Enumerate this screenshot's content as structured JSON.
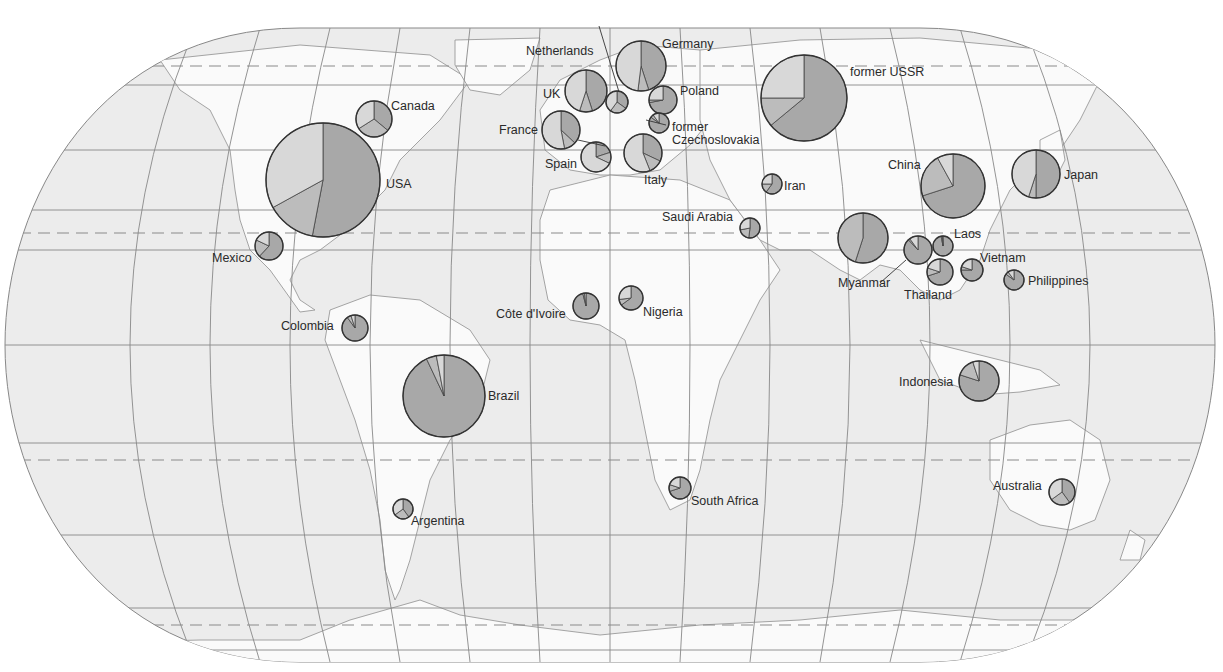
{
  "map": {
    "projection": "Eckert IV (rounded-edge world projection)",
    "colors": {
      "background": "#ffffff",
      "ocean": "#ececec",
      "land": "#fafafa",
      "graticule": "#888888",
      "tropic_dashes": "#8a8a8a",
      "coast": "#9a9a9a",
      "pie_dark": "#a8a8a8",
      "pie_mid": "#bcbcbc",
      "pie_light": "#d8d8d8",
      "pie_outline": "#333333"
    }
  },
  "chart_data": {
    "type": "pie",
    "title": "",
    "series_names": [
      "dark",
      "medium",
      "light"
    ],
    "countries": [
      {
        "name": "USA",
        "cx": 323,
        "cy": 180,
        "r": 57,
        "shares": [
          0.53,
          0.14,
          0.33
        ]
      },
      {
        "name": "Canada",
        "cx": 374,
        "cy": 119,
        "r": 18,
        "shares": [
          0.36,
          0.3,
          0.34
        ]
      },
      {
        "name": "Mexico",
        "cx": 269,
        "cy": 246,
        "r": 14,
        "shares": [
          0.62,
          0.2,
          0.18
        ]
      },
      {
        "name": "Colombia",
        "cx": 355,
        "cy": 328,
        "r": 13,
        "shares": [
          0.9,
          0.05,
          0.05
        ]
      },
      {
        "name": "Brazil",
        "cx": 444,
        "cy": 396,
        "r": 41,
        "shares": [
          0.93,
          0.04,
          0.03
        ]
      },
      {
        "name": "Argentina",
        "cx": 403,
        "cy": 509,
        "r": 10,
        "shares": [
          0.4,
          0.25,
          0.35
        ]
      },
      {
        "name": "UK",
        "cx": 586,
        "cy": 91,
        "r": 21,
        "shares": [
          0.45,
          0.1,
          0.45
        ]
      },
      {
        "name": "Netherlands",
        "cx": 617,
        "cy": 102,
        "r": 11,
        "shares": [
          0.35,
          0.25,
          0.4
        ]
      },
      {
        "name": "Germany",
        "cx": 641,
        "cy": 66,
        "r": 25,
        "shares": [
          0.45,
          0.07,
          0.48
        ]
      },
      {
        "name": "France",
        "cx": 561,
        "cy": 130,
        "r": 19,
        "shares": [
          0.37,
          0.1,
          0.53
        ]
      },
      {
        "name": "Spain",
        "cx": 596,
        "cy": 157,
        "r": 15,
        "shares": [
          0.2,
          0.12,
          0.68
        ]
      },
      {
        "name": "Italy",
        "cx": 643,
        "cy": 153,
        "r": 19,
        "shares": [
          0.32,
          0.12,
          0.56
        ]
      },
      {
        "name": "Poland",
        "cx": 663,
        "cy": 100,
        "r": 14,
        "shares": [
          0.72,
          0.03,
          0.25
        ]
      },
      {
        "name": "former Czechoslovakia",
        "cx": 659,
        "cy": 123,
        "r": 10,
        "shares": [
          0.85,
          0.05,
          0.1
        ]
      },
      {
        "name": "former USSR",
        "cx": 804,
        "cy": 98,
        "r": 43,
        "shares": [
          0.64,
          0.11,
          0.25
        ]
      },
      {
        "name": "Iran",
        "cx": 772,
        "cy": 184,
        "r": 10,
        "shares": [
          0.6,
          0.15,
          0.25
        ]
      },
      {
        "name": "Saudi Arabia",
        "cx": 750,
        "cy": 228,
        "r": 10,
        "shares": [
          0.52,
          0.2,
          0.28
        ]
      },
      {
        "name": "Côte d'Ivoire",
        "cx": 586,
        "cy": 306,
        "r": 13,
        "shares": [
          0.96,
          0.02,
          0.02
        ]
      },
      {
        "name": "Nigeria",
        "cx": 631,
        "cy": 298,
        "r": 12,
        "shares": [
          0.65,
          0.08,
          0.27
        ]
      },
      {
        "name": "South Africa",
        "cx": 680,
        "cy": 488,
        "r": 11,
        "shares": [
          0.7,
          0.1,
          0.2
        ]
      },
      {
        "name": "China",
        "cx": 953,
        "cy": 186,
        "r": 32,
        "shares": [
          0.7,
          0.22,
          0.08
        ]
      },
      {
        "name": "Japan",
        "cx": 1036,
        "cy": 174,
        "r": 24,
        "shares": [
          0.5,
          0.05,
          0.45
        ]
      },
      {
        "name": "Myanmar",
        "cx": 863,
        "cy": 238,
        "r": 25,
        "shares": [
          0.55,
          0.45,
          0.0
        ]
      },
      {
        "name": "Laos",
        "cx": 943,
        "cy": 246,
        "r": 10,
        "shares": [
          0.97,
          0.02,
          0.01
        ]
      },
      {
        "name": "Thailand",
        "cx": 918,
        "cy": 250,
        "r": 14,
        "shares": [
          0.88,
          0.02,
          0.1
        ]
      },
      {
        "name": "Thailand-south",
        "cx": 940,
        "cy": 272,
        "r": 13,
        "shares": [
          0.7,
          0.1,
          0.2
        ]
      },
      {
        "name": "Vietnam",
        "cx": 972,
        "cy": 270,
        "r": 11,
        "shares": [
          0.75,
          0.05,
          0.2
        ]
      },
      {
        "name": "Philippines",
        "cx": 1014,
        "cy": 280,
        "r": 10,
        "shares": [
          0.85,
          0.05,
          0.1
        ]
      },
      {
        "name": "Indonesia",
        "cx": 979,
        "cy": 381,
        "r": 20,
        "shares": [
          0.8,
          0.15,
          0.05
        ]
      },
      {
        "name": "Australia",
        "cx": 1062,
        "cy": 492,
        "r": 13,
        "shares": [
          0.4,
          0.25,
          0.35
        ]
      }
    ]
  },
  "labels": {
    "usa": "USA",
    "canada": "Canada",
    "mexico": "Mexico",
    "colombia": "Colombia",
    "brazil": "Brazil",
    "argentina": "Argentina",
    "uk": "UK",
    "netherlands": "Netherlands",
    "germany": "Germany",
    "france": "France",
    "spain": "Spain",
    "italy": "Italy",
    "poland": "Poland",
    "czech_1": "former",
    "czech_2": "Czechoslovakia",
    "ussr": "former USSR",
    "iran": "Iran",
    "saudi": "Saudi Arabia",
    "ivoire": "Côte d'Ivoire",
    "nigeria": "Nigeria",
    "south_africa": "South Africa",
    "china": "China",
    "japan": "Japan",
    "myanmar": "Myanmar",
    "laos": "Laos",
    "thailand": "Thailand",
    "vietnam": "Vietnam",
    "philippines": "Philippines",
    "indonesia": "Indonesia",
    "australia": "Australia"
  }
}
